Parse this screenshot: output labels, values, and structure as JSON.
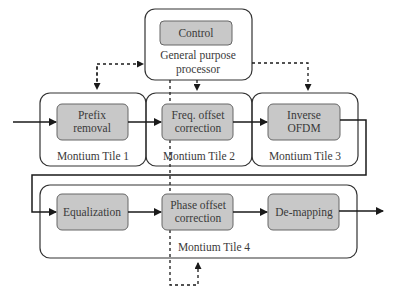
{
  "diagram": {
    "controller": {
      "control_label": "Control",
      "gpp_line1": "General purpose",
      "gpp_line2": "processor"
    },
    "tiles": [
      {
        "label": "Montium Tile 1",
        "block_line1": "Prefix",
        "block_line2": "removal"
      },
      {
        "label": "Montium Tile 2",
        "block_line1": "Freq. offset",
        "block_line2": "correction"
      },
      {
        "label": "Montium Tile 3",
        "block_line1": "Inverse",
        "block_line2": "OFDM"
      },
      {
        "label": "Montium Tile 4",
        "blocks": [
          {
            "line1": "Equalization"
          },
          {
            "line1": "Phase offset",
            "line2": "correction"
          },
          {
            "line1": "De-mapping"
          }
        ]
      }
    ],
    "colors": {
      "block_fill": "#c8c8c8",
      "block_stroke": "#666666",
      "line": "#1a1a1a"
    }
  }
}
